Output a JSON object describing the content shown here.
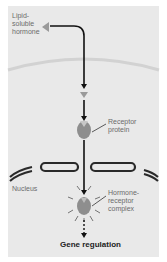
{
  "labels": {
    "hormone": "Lipid-\nsoluble\nhormone",
    "hormone_l1": "Lipid-",
    "hormone_l2": "soluble",
    "hormone_l3": "hormone",
    "receptor_l1": "Receptor",
    "receptor_l2": "protein",
    "nucleus": "Nucleus",
    "complex_l1": "Hormone-",
    "complex_l2": "receptor",
    "complex_l3": "complex",
    "caption": "Gene regulation"
  },
  "colors": {
    "background": "#e9e9e9",
    "membrane": "#d6d6d6",
    "nuclear_envelope": "#2a2a2a",
    "hormone": "#9a9a9a",
    "receptor": "#8a8a8a",
    "arrow": "#111111"
  }
}
